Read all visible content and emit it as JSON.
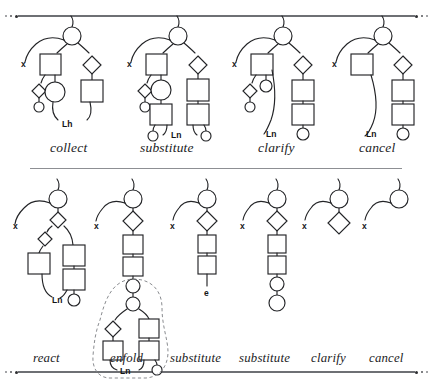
{
  "figure": {
    "background": "#ffffff",
    "ink": "#1b1c1e",
    "rule_color": "#6e7074",
    "dashed_color": "#7a7c80"
  },
  "rows": [
    {
      "name": "top-row",
      "panels": [
        {
          "id": "collect",
          "caption": "collect"
        },
        {
          "id": "substitute1",
          "caption": "substitute"
        },
        {
          "id": "clarify1",
          "caption": "clarify"
        },
        {
          "id": "cancel1",
          "caption": "cancel"
        }
      ]
    },
    {
      "name": "bottom-row",
      "panels": [
        {
          "id": "react",
          "caption": "react"
        },
        {
          "id": "enfold",
          "caption": "enfold"
        },
        {
          "id": "substitute2",
          "caption": "substitute"
        },
        {
          "id": "substitute3",
          "caption": "substitute"
        },
        {
          "id": "clarify2",
          "caption": "clarify"
        },
        {
          "id": "cancel2",
          "caption": "cancel"
        }
      ]
    }
  ],
  "node_labels": {
    "x": "x",
    "Lh": "Lh",
    "Ln": "Ln",
    "e": "e"
  },
  "annotations": {
    "top_collect_leaf": "Lh",
    "top_substitute_leaf": "Ln",
    "top_clarify_leaf": "Ln",
    "top_cancel_leaf": "Ln",
    "bottom_react_leaf": "Ln",
    "bottom_enfold_leaf": "Ln",
    "bottom_substitute2_leaf": "e"
  },
  "ornaments": {
    "top_rule": "dot-dot-dot-bar-dot-dot-dot",
    "bottom_rule": "dot-dot-dot-bar-dot-dot-dot",
    "middle_rule": "plain-hairline"
  }
}
